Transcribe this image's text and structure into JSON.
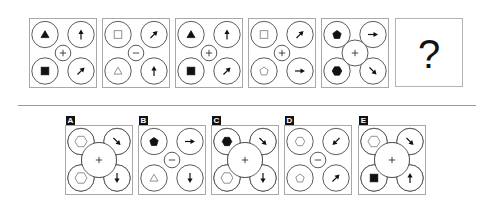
{
  "puzzle": {
    "question_mark": "?",
    "sequence": [
      {
        "x": 29,
        "y": 18,
        "center": {
          "op": "plus",
          "size": "small"
        },
        "tl": {
          "shape": "triangle",
          "fill": "filled"
        },
        "tr": {
          "shape": "arrow",
          "dir": "up"
        },
        "bl": {
          "shape": "square",
          "fill": "filled"
        },
        "br": {
          "shape": "arrow",
          "dir": "up-right"
        }
      },
      {
        "x": 102,
        "y": 18,
        "center": {
          "op": "minus",
          "size": "small"
        },
        "tl": {
          "shape": "square",
          "fill": "hollow"
        },
        "tr": {
          "shape": "arrow",
          "dir": "up-right"
        },
        "bl": {
          "shape": "triangle",
          "fill": "hollow"
        },
        "br": {
          "shape": "arrow",
          "dir": "up"
        }
      },
      {
        "x": 175,
        "y": 18,
        "center": {
          "op": "plus",
          "size": "small"
        },
        "tl": {
          "shape": "triangle",
          "fill": "filled"
        },
        "tr": {
          "shape": "arrow",
          "dir": "up"
        },
        "bl": {
          "shape": "square",
          "fill": "filled"
        },
        "br": {
          "shape": "arrow",
          "dir": "up-right"
        }
      },
      {
        "x": 248,
        "y": 18,
        "center": {
          "op": "plus",
          "size": "small"
        },
        "tl": {
          "shape": "square",
          "fill": "hollow"
        },
        "tr": {
          "shape": "arrow",
          "dir": "up-right"
        },
        "bl": {
          "shape": "pentagon",
          "fill": "hollow"
        },
        "br": {
          "shape": "arrow",
          "dir": "right"
        }
      },
      {
        "x": 321,
        "y": 18,
        "center": {
          "op": "plus",
          "size": "medium"
        },
        "tl": {
          "shape": "pentagon",
          "fill": "filled"
        },
        "tr": {
          "shape": "arrow",
          "dir": "right"
        },
        "bl": {
          "shape": "hexagon",
          "fill": "filled"
        },
        "br": {
          "shape": "arrow",
          "dir": "down-right"
        }
      }
    ],
    "question_box": {
      "x": 395,
      "y": 18
    },
    "options": [
      {
        "label": "A",
        "x": 65,
        "y": 125,
        "center": {
          "op": "plus",
          "size": "large"
        },
        "tl": {
          "shape": "hexagon",
          "fill": "hollow"
        },
        "tr": {
          "shape": "arrow",
          "dir": "down-right"
        },
        "bl": {
          "shape": "hexagon",
          "fill": "hollow"
        },
        "br": {
          "shape": "arrow",
          "dir": "down"
        }
      },
      {
        "label": "B",
        "x": 138,
        "y": 125,
        "center": {
          "op": "minus",
          "size": "small"
        },
        "tl": {
          "shape": "pentagon",
          "fill": "filled"
        },
        "tr": {
          "shape": "arrow",
          "dir": "right"
        },
        "bl": {
          "shape": "triangle",
          "fill": "hollow"
        },
        "br": {
          "shape": "arrow",
          "dir": "down"
        }
      },
      {
        "label": "C",
        "x": 211,
        "y": 125,
        "center": {
          "op": "plus",
          "size": "large"
        },
        "tl": {
          "shape": "hexagon",
          "fill": "filled"
        },
        "tr": {
          "shape": "arrow",
          "dir": "down-right"
        },
        "bl": {
          "shape": "hexagon",
          "fill": "hollow"
        },
        "br": {
          "shape": "arrow",
          "dir": "down"
        }
      },
      {
        "label": "D",
        "x": 284,
        "y": 125,
        "center": {
          "op": "minus",
          "size": "small"
        },
        "tl": {
          "shape": "hexagon",
          "fill": "hollow"
        },
        "tr": {
          "shape": "arrow",
          "dir": "down-left"
        },
        "bl": {
          "shape": "pentagon",
          "fill": "hollow"
        },
        "br": {
          "shape": "arrow",
          "dir": "up-right"
        }
      },
      {
        "label": "E",
        "x": 358,
        "y": 125,
        "center": {
          "op": "plus",
          "size": "large"
        },
        "tl": {
          "shape": "hexagon",
          "fill": "hollow"
        },
        "tr": {
          "shape": "arrow",
          "dir": "down-right"
        },
        "bl": {
          "shape": "square",
          "fill": "filled"
        },
        "br": {
          "shape": "arrow",
          "dir": "up"
        }
      }
    ]
  }
}
